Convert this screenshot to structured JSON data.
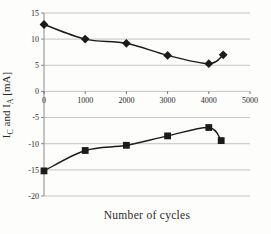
{
  "figure": {
    "xlabel": "Number of cycles",
    "ylabel_parts": [
      {
        "text": "I"
      },
      {
        "text": "C",
        "sub": true
      },
      {
        "text": " and I"
      },
      {
        "text": "A",
        "sub": true
      },
      {
        "text": " [mA]"
      }
    ],
    "colors": {
      "background": "#fdfdfc",
      "grid": "#bdbdbd",
      "axis": "#8a8a8a",
      "tick": "#6a6a6a",
      "text": "#2a2a2a",
      "series": "#1b1b1b"
    }
  },
  "chart_data": {
    "type": "line",
    "title": "",
    "xlabel": "Number of cycles",
    "ylabel": "I_C and I_A [mA]",
    "xlim": [
      0,
      5000
    ],
    "ylim": [
      -20,
      15
    ],
    "x_ticks": [
      0,
      1000,
      2000,
      3000,
      4000,
      5000
    ],
    "y_ticks": [
      15,
      10,
      5,
      0,
      -5,
      -10,
      -15,
      -20
    ],
    "grid": "horizontal-only",
    "legend": "none",
    "line_style": "smoothed",
    "series": [
      {
        "name": "I_C",
        "marker": "diamond",
        "x": [
          0,
          1000,
          2000,
          3000,
          4000,
          4350
        ],
        "y": [
          12.8,
          10.0,
          9.2,
          6.9,
          5.3,
          7.0
        ]
      },
      {
        "name": "I_A",
        "marker": "square",
        "x": [
          0,
          1000,
          2000,
          3000,
          4000,
          4300
        ],
        "y": [
          -15.2,
          -11.3,
          -10.3,
          -8.5,
          -6.9,
          -9.4
        ]
      }
    ]
  }
}
